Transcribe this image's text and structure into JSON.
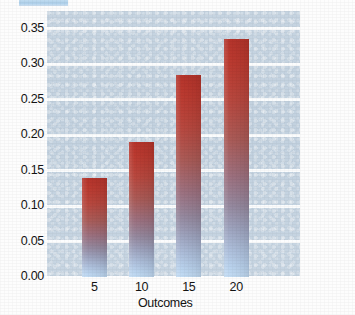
{
  "chart_data": {
    "type": "bar",
    "title": "",
    "xlabel": "Outcomes",
    "ylabel": "Probabilties",
    "categories": [
      "5",
      "10",
      "15",
      "20"
    ],
    "values": [
      0.14,
      0.19,
      0.285,
      0.335
    ],
    "ylim": [
      0.0,
      0.375
    ],
    "yticks": [
      "0.00",
      "0.05",
      "0.10",
      "0.15",
      "0.20",
      "0.25",
      "0.30",
      "0.35"
    ],
    "ytick_values": [
      0.0,
      0.05,
      0.1,
      0.15,
      0.2,
      0.25,
      0.3,
      0.35
    ],
    "xticks": [
      "5",
      "10",
      "15",
      "20"
    ],
    "grid": true,
    "legend": false,
    "legend_position": "none",
    "colors": {
      "plot_background": "#c4d2e0",
      "gridline": "#ffffff",
      "bar_top": "#b5342b",
      "bar_mid": "#9d7180",
      "bar_bottom": "#c3dcf4",
      "text": "#141414",
      "page_background": "#fdfdfd",
      "artifact": "#b4d3ed"
    }
  }
}
